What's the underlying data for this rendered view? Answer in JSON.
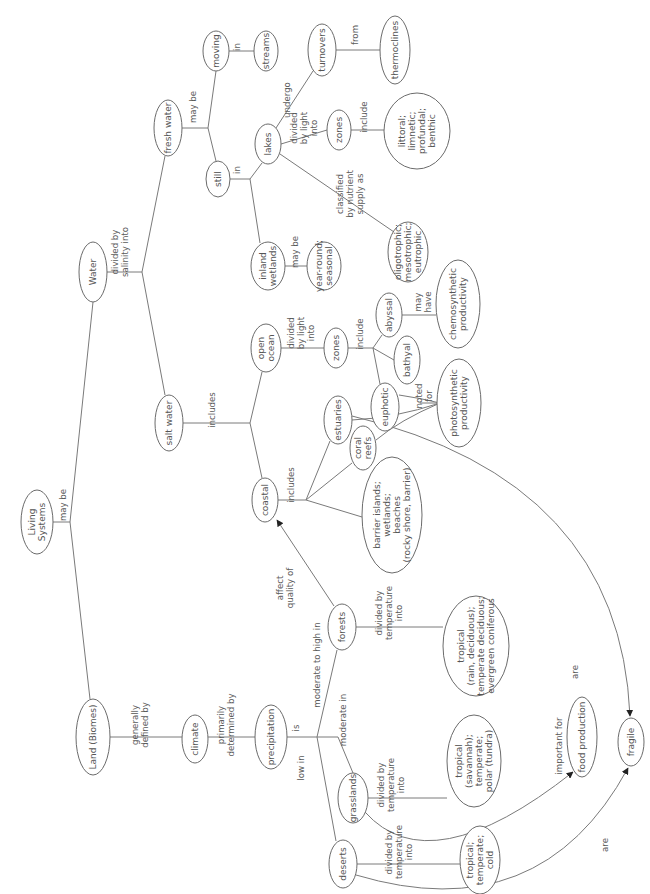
{
  "diagram": {
    "type": "concept-map",
    "orientation": "rotated-90-ccw",
    "colors": {
      "line": "#7a7a7a",
      "node_border": "#6b6b6b",
      "text": "#555555",
      "arrow": "#222222",
      "background": "#ffffff"
    },
    "nodes": {
      "living_systems": [
        "Living",
        "Systems"
      ],
      "water": [
        "Water"
      ],
      "land": [
        "Land (Biomes)"
      ],
      "fresh_water": [
        "fresh water"
      ],
      "salt_water": [
        "salt water"
      ],
      "moving": [
        "moving"
      ],
      "streams": [
        "streams"
      ],
      "still": [
        "still"
      ],
      "lakes": [
        "lakes"
      ],
      "inland_wetlands": [
        "inland",
        "wetlands"
      ],
      "year_round": [
        "year-round;",
        "seasonal"
      ],
      "turnovers": [
        "turnovers"
      ],
      "thermoclines": [
        "thermoclines"
      ],
      "lake_zones": [
        "zones"
      ],
      "lake_zone_types": [
        "littoral;",
        "limnetic;",
        "profundal;",
        "benthic"
      ],
      "trophic": [
        "oligotrophic;",
        "mesotrophic;",
        "eutrophic"
      ],
      "open_ocean": [
        "open",
        "ocean"
      ],
      "ocean_zones": [
        "zones"
      ],
      "abyssal": [
        "abyssal"
      ],
      "bathyal": [
        "bathyal"
      ],
      "euphotic": [
        "euphotic"
      ],
      "chemosynthetic": [
        "chemosynthetic",
        "productivity"
      ],
      "photosynthetic": [
        "photosynthetic",
        "productivity"
      ],
      "estuaries": [
        "estuaries"
      ],
      "coral_reefs": [
        "coral",
        "reefs"
      ],
      "barrier_islands": [
        "barrier islands;",
        "wetlands;",
        "beaches",
        "(rocky shore, barrier)"
      ],
      "coastal": [
        "coastal"
      ],
      "forests": [
        "forests"
      ],
      "forest_types": [
        "tropical",
        "(rain, deciduous);",
        "temperate deciduous;",
        "evergreen coniferous"
      ],
      "grasslands": [
        "grasslands"
      ],
      "grassland_types": [
        "tropical",
        "(savannah);",
        "temperate;",
        "polar (tundra)"
      ],
      "food_production": [
        "food production"
      ],
      "climate": [
        "climate"
      ],
      "precipitation": [
        "precipitation"
      ],
      "deserts": [
        "deserts"
      ],
      "desert_types": [
        "tropical;",
        "temperate;",
        "cold"
      ],
      "fragile": [
        "fragile"
      ]
    },
    "links": {
      "may_be_root": [
        "may be"
      ],
      "divided_salinity": [
        "divided by",
        "salinity into"
      ],
      "fresh_may_be": [
        "may be"
      ],
      "moving_in": [
        "in"
      ],
      "still_in": [
        "in"
      ],
      "undergo": [
        "undergo"
      ],
      "from": [
        "from"
      ],
      "lake_divided_light": [
        "divided",
        "by light",
        "into"
      ],
      "lake_include": [
        "include"
      ],
      "classified": [
        "classified",
        "by nutrient",
        "supply as"
      ],
      "wetlands_may_be": [
        "may be"
      ],
      "salt_includes": [
        "includes"
      ],
      "ocean_divided_light": [
        "divided",
        "by light",
        "into"
      ],
      "ocean_include": [
        "include"
      ],
      "may_have": [
        "may",
        "have"
      ],
      "noted_for": [
        "noted",
        "for"
      ],
      "coastal_includes": [
        "includes"
      ],
      "affect_quality": [
        "affect",
        "quality of"
      ],
      "forest_divided_temp": [
        "divided by",
        "temperature",
        "into"
      ],
      "generally_defined": [
        "generally",
        "defined by"
      ],
      "primarily_determined": [
        "primarily",
        "determined by"
      ],
      "is": [
        "is"
      ],
      "moderate_high": [
        "moderate to high in"
      ],
      "moderate": [
        "moderate in"
      ],
      "low": [
        "low in"
      ],
      "grass_divided_temp": [
        "divided by",
        "temperature",
        "into"
      ],
      "important_for": [
        "important for"
      ],
      "desert_divided_temp": [
        "divided by",
        "temperature",
        "into"
      ],
      "are_estuaries": [
        "are"
      ],
      "are_deserts": [
        "are"
      ]
    }
  }
}
